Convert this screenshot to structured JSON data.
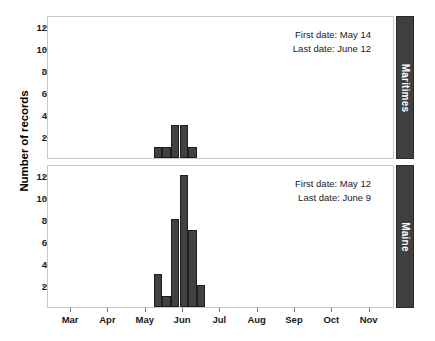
{
  "chart_data": {
    "type": "bar",
    "title": "",
    "xlabel": "",
    "ylabel": "Number of records",
    "ylim": [
      0,
      13
    ],
    "yticks": [
      2,
      4,
      6,
      8,
      10,
      12
    ],
    "xticks": [
      "Mar",
      "Apr",
      "May",
      "Jun",
      "Jul",
      "Aug",
      "Sep",
      "Oct",
      "Nov"
    ],
    "grid": false,
    "legend": "none",
    "facet_layout": "2 rows x 1 column, strip labels on right",
    "panels": [
      {
        "strip_label": "Maritimes",
        "annotations": {
          "first_date": "First date: May 14",
          "last_date": "Last date: June 12"
        },
        "bin_width_days": 7,
        "categories": [
          "May 10",
          "May 17",
          "May 24",
          "May 31",
          "Jun 7"
        ],
        "values": [
          1,
          1,
          3,
          3,
          1
        ]
      },
      {
        "strip_label": "Maine",
        "annotations": {
          "first_date": "First date: May 12",
          "last_date": "Last date: June 9"
        },
        "bin_width_days": 7,
        "categories": [
          "May 10",
          "May 17",
          "May 24",
          "May 31",
          "Jun 7",
          "Jun 14"
        ],
        "values": [
          3,
          1,
          8,
          12,
          7,
          2
        ]
      }
    ],
    "colors": {
      "bar_fill": "#414141",
      "bar_border": "#1e1e1e",
      "strip_background": "#3f3f3f",
      "strip_text": "#ffffff",
      "panel_border": "#c8c8c8",
      "axis_text": "#1a1a1a",
      "background": "#ffffff"
    }
  }
}
